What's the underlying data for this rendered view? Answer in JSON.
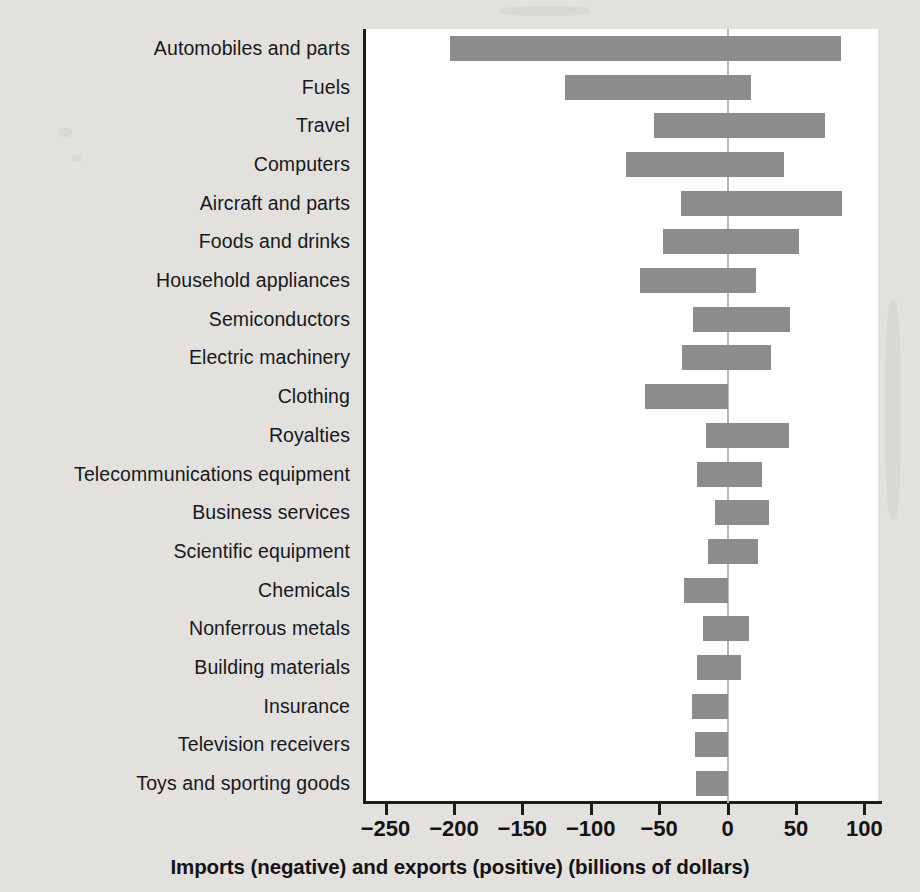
{
  "chart_data": {
    "type": "bar",
    "orientation": "horizontal",
    "title": "",
    "xlabel": "Imports (negative) and exports (positive) (billions of dollars)",
    "ylabel": "",
    "xlim": [
      -265,
      110
    ],
    "xticks": [
      -250,
      -200,
      -150,
      -100,
      -50,
      0,
      50,
      100
    ],
    "xticklabels": [
      "−250",
      "−200",
      "−150",
      "−100",
      "−50",
      "0",
      "50",
      "100"
    ],
    "grid": false,
    "legend": null,
    "bar_color": "#8c8c8c",
    "zero_line_color": "#b9b9b7",
    "background_color": "#e2e1de",
    "plot_background_color": "#ffffff",
    "categories": [
      "Automobiles and parts",
      "Fuels",
      "Travel",
      "Computers",
      "Aircraft and parts",
      "Foods and drinks",
      "Household appliances",
      "Semiconductors",
      "Electric machinery",
      "Clothing",
      "Royalties",
      "Telecommunications equipment",
      "Business services",
      "Scientific equipment",
      "Chemicals",
      "Nonferrous metals",
      "Building materials",
      "Insurance",
      "Television receivers",
      "Toys and sporting goods"
    ],
    "series": [
      {
        "name": "Imports (negative)",
        "values": [
          -203,
          -119,
          -54,
          -74,
          -34,
          -47,
          -64,
          -25,
          -33,
          -60,
          -16,
          -22,
          -9,
          -14,
          -32,
          -18,
          -22,
          -26,
          -24,
          -23
        ]
      },
      {
        "name": "Exports (positive)",
        "values": [
          83,
          17,
          71,
          41,
          84,
          52,
          21,
          46,
          32,
          0,
          45,
          25,
          30,
          22,
          0,
          16,
          10,
          0,
          0,
          0
        ]
      }
    ]
  }
}
